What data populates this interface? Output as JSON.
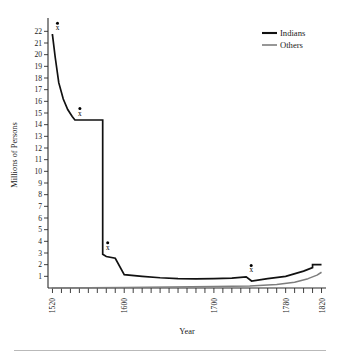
{
  "chart_data": {
    "type": "line",
    "title": "",
    "xlabel": "Year",
    "ylabel": "Millions of Persons",
    "xlim": [
      1515,
      1825
    ],
    "ylim": [
      0,
      22.8
    ],
    "grid": false,
    "legend_position": "top-right",
    "x_ticks_major": [
      1520,
      1600,
      1700,
      1780,
      1820
    ],
    "x_tick_labels": [
      "1520",
      "1600",
      "1700",
      "1780",
      "1820"
    ],
    "x_tick_interval": 10,
    "y_ticks": [
      1,
      2,
      3,
      4,
      5,
      6,
      7,
      8,
      9,
      10,
      11,
      12,
      13,
      14,
      15,
      16,
      17,
      18,
      19,
      20,
      21,
      22
    ],
    "y_tick_labels": [
      "1",
      "2",
      "3",
      "4",
      "5",
      "6",
      "7",
      "8",
      "9",
      "10",
      "11",
      "12",
      "13",
      "14",
      "15",
      "16",
      "17",
      "18",
      "19",
      "20",
      "21",
      "22"
    ],
    "series": [
      {
        "name": "Indians",
        "color": "#111111",
        "x": [
          1519,
          1520,
          1523,
          1527,
          1532,
          1537,
          1542,
          1545,
          1545,
          1548,
          1555,
          1565,
          1576,
          1576,
          1580,
          1590,
          1600,
          1620,
          1640,
          1660,
          1680,
          1700,
          1720,
          1736,
          1736,
          1742,
          1760,
          1780,
          1800,
          1810,
          1810,
          1820
        ],
        "y": [
          21.7,
          21.7,
          19.8,
          17.6,
          16.2,
          15.3,
          14.7,
          14.4,
          14.4,
          14.4,
          14.4,
          14.4,
          14.4,
          2.9,
          2.7,
          2.55,
          1.15,
          1.0,
          0.88,
          0.8,
          0.78,
          0.8,
          0.85,
          0.95,
          0.95,
          0.6,
          0.8,
          1.0,
          1.45,
          1.75,
          2.0,
          2.0
        ]
      },
      {
        "name": "Others",
        "color": "#7d7d7d",
        "x": [
          1519,
          1560,
          1600,
          1650,
          1700,
          1740,
          1770,
          1790,
          1805,
          1815,
          1820
        ],
        "y": [
          0.0,
          0.02,
          0.05,
          0.08,
          0.12,
          0.18,
          0.3,
          0.5,
          0.8,
          1.1,
          1.35
        ]
      }
    ],
    "annotations": [
      {
        "label": "x",
        "marker": "x-with-dot",
        "year": 1520,
        "value": 21.7
      },
      {
        "label": "x",
        "marker": "x-with-dot",
        "year": 1545,
        "value": 14.4
      },
      {
        "label": "x",
        "marker": "x-with-dot",
        "year": 1576,
        "value": 2.9
      },
      {
        "label": "x",
        "marker": "x-with-dot",
        "year": 1736,
        "value": 0.95
      }
    ]
  },
  "legend": {
    "items": [
      {
        "label": "Indians",
        "color": "#111111"
      },
      {
        "label": "Others",
        "color": "#7d7d7d"
      }
    ]
  },
  "axes": {
    "x_title": "Year",
    "y_title": "Millions of Persons"
  }
}
